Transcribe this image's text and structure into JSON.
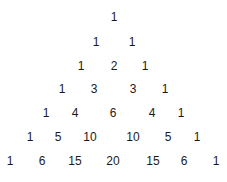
{
  "diagram": {
    "title": "",
    "rows": [
      {
        "y": 17,
        "cells": [
          {
            "v": "1",
            "x": 114
          }
        ]
      },
      {
        "y": 42,
        "cells": [
          {
            "v": "1",
            "x": 96
          },
          {
            "v": "1",
            "x": 132
          }
        ]
      },
      {
        "y": 66,
        "cells": [
          {
            "v": "1",
            "x": 81
          },
          {
            "v": "2",
            "x": 114
          },
          {
            "v": "1",
            "x": 145
          }
        ]
      },
      {
        "y": 89,
        "cells": [
          {
            "v": "1",
            "x": 62
          },
          {
            "v": "3",
            "x": 94
          },
          {
            "v": "3",
            "x": 133
          },
          {
            "v": "1",
            "x": 165
          }
        ]
      },
      {
        "y": 113,
        "cells": [
          {
            "v": "1",
            "x": 46
          },
          {
            "v": "4",
            "x": 75
          },
          {
            "v": "6",
            "x": 113
          },
          {
            "v": "4",
            "x": 152
          },
          {
            "v": "1",
            "x": 181
          }
        ]
      },
      {
        "y": 137,
        "cells": [
          {
            "v": "1",
            "x": 30
          },
          {
            "v": "5",
            "x": 58
          },
          {
            "v": "10",
            "x": 90
          },
          {
            "v": "10",
            "x": 133
          },
          {
            "v": "5",
            "x": 168
          },
          {
            "v": "1",
            "x": 197
          }
        ]
      },
      {
        "y": 161,
        "cells": [
          {
            "v": "1",
            "x": 10
          },
          {
            "v": "6",
            "x": 42
          },
          {
            "v": "15",
            "x": 75
          },
          {
            "v": "20",
            "x": 113
          },
          {
            "v": "15",
            "x": 153
          },
          {
            "v": "6",
            "x": 184
          },
          {
            "v": "1",
            "x": 216
          }
        ]
      }
    ]
  }
}
